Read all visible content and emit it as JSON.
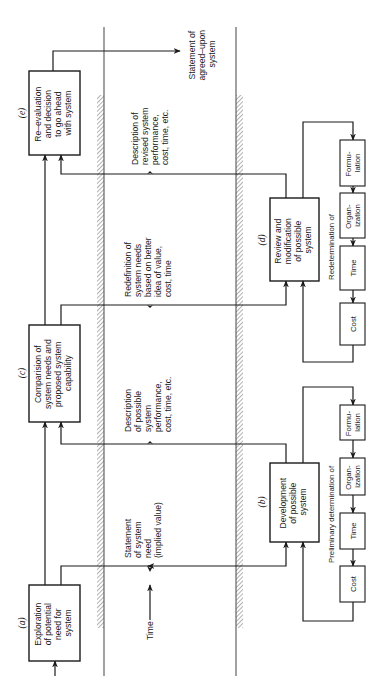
{
  "diagram": {
    "time_label": "Time",
    "stages": {
      "a": {
        "label": "(a)",
        "lines": [
          "Exploration",
          "of potential",
          "need for",
          "system"
        ]
      },
      "b": {
        "label": "(b)",
        "lines": [
          "Development",
          "of possible",
          "system"
        ]
      },
      "c": {
        "label": "(c)",
        "lines": [
          "Comparision of",
          "system needs and",
          "proposed system",
          "capability"
        ]
      },
      "d": {
        "label": "(d)",
        "lines": [
          "Review and",
          "modification",
          "of possible",
          "system"
        ]
      },
      "e": {
        "label": "(e)",
        "lines": [
          "Re–evaluation",
          "and decision",
          "to go ahead",
          "with system"
        ]
      }
    },
    "flows": {
      "a_to_b": [
        "Statement",
        "of system",
        "need",
        "(implied value)"
      ],
      "b_to_c": [
        "Description",
        "of possible",
        "system",
        "performance,",
        "cost, time, etc."
      ],
      "c_to_d": [
        "Redefinition of",
        "system needs",
        "based on better",
        "idea of value,",
        "cost, time"
      ],
      "d_to_e": [
        "Description of",
        "revised system",
        "performance,",
        "cost, time, etc."
      ],
      "e_out": [
        "Statement of",
        "agreed–upon",
        "system"
      ]
    },
    "loops": {
      "preliminary": {
        "title": "Preliminary determination of",
        "steps": [
          [
            "Formu-",
            "lation"
          ],
          [
            "Organ-",
            "ization"
          ],
          [
            "Time"
          ],
          [
            "Cost"
          ]
        ]
      },
      "redetermination": {
        "title": "Redetermination of",
        "steps": [
          [
            "Formu-",
            "lation"
          ],
          [
            "Organ-",
            "ization"
          ],
          [
            "Time"
          ],
          [
            "Cost"
          ]
        ]
      }
    }
  }
}
